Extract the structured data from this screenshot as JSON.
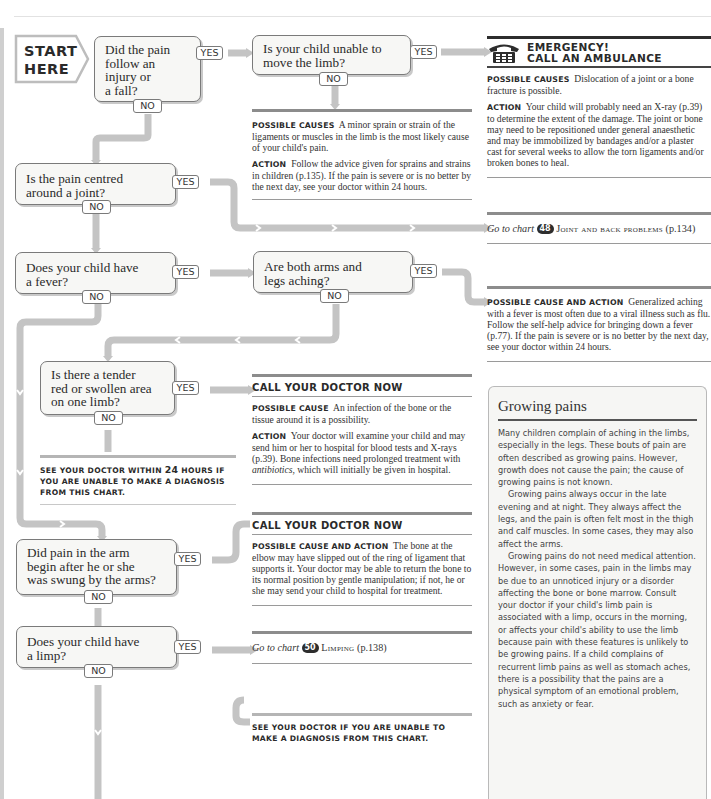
{
  "chart": {
    "start_label": [
      "START",
      "HERE"
    ],
    "colors": {
      "connector": "#c4c4c4",
      "box_border": "#7a7a7a",
      "box_fill": "#f7f7f5",
      "dark_bar": "#2d2d2d",
      "mid_bar": "#8c8c8c"
    },
    "questions": [
      {
        "id": "q1",
        "text": "Did the pain follow an injury or a fall?",
        "lines": [
          "Did the pain",
          "follow an",
          "injury or",
          "a fall?"
        ],
        "yes": "YES",
        "no": "NO"
      },
      {
        "id": "q2",
        "text": "Is your child unable to move the limb?",
        "lines": [
          "Is your child unable to",
          "move the limb?"
        ],
        "yes": "YES",
        "no": "NO"
      },
      {
        "id": "q3",
        "text": "Is the pain centred around a joint?",
        "lines": [
          "Is the pain centred",
          "around a joint?"
        ],
        "yes": "YES",
        "no": "NO"
      },
      {
        "id": "q4",
        "text": "Does your child have a fever?",
        "lines": [
          "Does your child have",
          "a fever?"
        ],
        "yes": "YES",
        "no": "NO"
      },
      {
        "id": "q5",
        "text": "Are both arms and legs aching?",
        "lines": [
          "Are both arms and",
          "legs aching?"
        ],
        "yes": "YES",
        "no": "NO"
      },
      {
        "id": "q6",
        "text": "Is there a tender red or swollen area on one limb?",
        "lines": [
          "Is there a tender",
          "red or swollen area",
          "on one limb?"
        ],
        "yes": "YES",
        "no": "NO"
      },
      {
        "id": "q7",
        "text": "Did pain in the arm begin after he or she was swung by the arms?",
        "lines": [
          "Did pain in the arm",
          "begin after he or she",
          "was swung by the arms?"
        ],
        "yes": "YES",
        "no": "NO"
      },
      {
        "id": "q8",
        "text": "Does your child have a limp?",
        "lines": [
          "Does your child have",
          "a limp?"
        ],
        "yes": "YES",
        "no": "NO"
      }
    ],
    "results": {
      "emergency": {
        "title_line1": "EMERGENCY!",
        "title_line2": "CALL AN AMBULANCE",
        "icon": "telephone-icon",
        "causes_label": "Possible causes",
        "causes_text": "Dislocation of a joint or a bone fracture is possible.",
        "action_label": "Action",
        "action_text": "Your child will probably need an X-ray (p.39) to determine the extent of the damage. The joint or bone may need to be repositioned under general anaesthetic and may be immobilized by bandages and/or a plaster cast for several weeks to allow the torn ligaments and/or broken bones to heal."
      },
      "sprain": {
        "causes_label": "Possible causes",
        "causes_text": "A minor sprain or strain of the ligaments or muscles in the limb is the most likely cause of your child's pain.",
        "action_label": "Action",
        "action_text": "Follow the advice given for sprains and strains in children (p.135). If the pain is severe or is no better by the next day, see your doctor within 24 hours."
      },
      "joint_chart": {
        "goto": "Go to chart",
        "chart_number": "48",
        "chart_title": "Joint and back problems",
        "page": "(p.134)"
      },
      "viral": {
        "label": "Possible cause and action",
        "text": "Generalized aching with a fever is most often due to a viral illness such as flu. Follow the self-help advice for bringing down a fever (p.77). If the pain is severe or is no better by the next day, see your doctor within 24 hours."
      },
      "infection": {
        "header": "CALL YOUR DOCTOR NOW",
        "cause_label": "Possible cause",
        "cause_text": "An infection of the bone or the tissue around it is a possibility.",
        "action_label": "Action",
        "action_text_before": "Your doctor will examine your child and may send him or her to hospital for blood tests and X-rays (p.39). Bone infections need prolonged treatment with ",
        "action_text_italic": "antibiotics",
        "action_text_after": ", which will initially be given in hospital."
      },
      "see_doctor_24": {
        "text_before": "See your doctor within ",
        "hours": "24",
        "text_after": " hours if you are unable to make a diagnosis from this chart."
      },
      "elbow": {
        "header": "CALL YOUR DOCTOR NOW",
        "label": "Possible cause and action",
        "text": "The bone at the elbow may have slipped out of the ring of ligament that supports it. Your doctor may be able to return the bone to its normal position by gentle manipulation; if not, he or she may send your child to hospital for treatment."
      },
      "limp_chart": {
        "goto": "Go to chart",
        "chart_number": "50",
        "chart_title": "Limping",
        "page": "(p.138)"
      },
      "see_doctor_final": {
        "text": "See your doctor if you are unable to make a diagnosis from this chart."
      }
    },
    "sidebar": {
      "title": "Growing pains",
      "paragraphs": [
        "Many children complain of aching in the limbs, especially in the legs. These bouts of pain are often described as growing pains. However, growth does not cause the pain; the cause of growing pains is not known.",
        "Growing pains always occur in the late evening and at night. They always affect the legs, and the pain is often felt most in the thigh and calf muscles. In some cases, they may also affect the arms.",
        "Growing pains do not need medical attention. However, in some cases, pain in the limbs may be due to an unnoticed injury or a disorder affecting the bone or bone marrow. Consult your doctor if your child's limb pain is associated with a limp, occurs in the morning, or affects your child's ability to use the limb because pain with these features is unlikely to be growing pains. If a child complains of recurrent limb pains as well as stomach aches, there is a possibility that the pains are a physical symptom of an emotional problem, such as anxiety or fear."
      ]
    }
  }
}
